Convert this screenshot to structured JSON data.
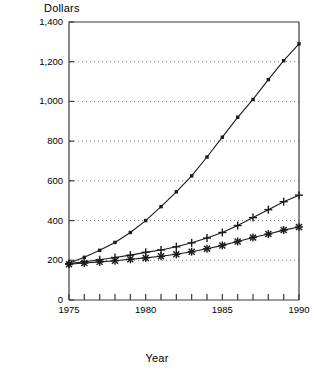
{
  "chart_data": {
    "type": "line",
    "title": "",
    "ylabel": "Dollars",
    "xlabel": "Year",
    "xlim": [
      1975,
      1990
    ],
    "ylim": [
      0,
      1400
    ],
    "grid": true,
    "legend": "none",
    "y_ticks": [
      0,
      200,
      400,
      600,
      800,
      1000,
      1200,
      1400
    ],
    "y_tick_labels": [
      "0",
      "200",
      "400",
      "600",
      "800",
      "1,000",
      "1,200",
      "1,400"
    ],
    "x_ticks": [
      1975,
      1976,
      1977,
      1978,
      1979,
      1980,
      1981,
      1982,
      1983,
      1984,
      1985,
      1986,
      1987,
      1988,
      1989,
      1990
    ],
    "x_tick_labels": [
      "1975",
      "",
      "",
      "",
      "",
      "1980",
      "",
      "",
      "",
      "",
      "1985",
      "",
      "",
      "",
      "",
      "1990"
    ],
    "x": [
      1975,
      1976,
      1977,
      1978,
      1979,
      1980,
      1981,
      1982,
      1983,
      1984,
      1985,
      1986,
      1987,
      1988,
      1989,
      1990
    ],
    "series": [
      {
        "name": "series-square",
        "marker": "square",
        "values": [
          185,
          215,
          250,
          290,
          340,
          400,
          470,
          545,
          625,
          720,
          820,
          920,
          1010,
          1110,
          1205,
          1290
        ]
      },
      {
        "name": "series-plus",
        "marker": "plus",
        "values": [
          183,
          193,
          203,
          214,
          226,
          240,
          252,
          268,
          288,
          312,
          340,
          375,
          415,
          455,
          495,
          528
        ]
      },
      {
        "name": "series-star",
        "marker": "star",
        "values": [
          180,
          186,
          192,
          198,
          205,
          212,
          220,
          230,
          243,
          258,
          275,
          295,
          315,
          332,
          352,
          368
        ]
      }
    ]
  },
  "colors": {
    "axis": "#3a3a3a",
    "line": "#1a1a1a",
    "grid": "#555555",
    "background": "#ffffff"
  }
}
